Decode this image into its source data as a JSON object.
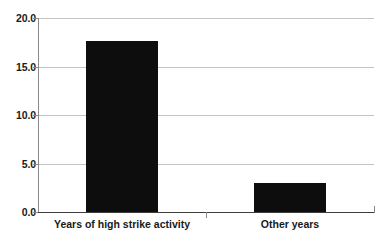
{
  "chart_data": {
    "type": "bar",
    "title": "",
    "subtitle": "",
    "xlabel": "",
    "ylabel": "",
    "categories": [
      "Years of high strike activity",
      "Other years"
    ],
    "values": [
      17.6,
      3.0
    ],
    "series": [
      {
        "name": "",
        "values": [
          17.6,
          3.0
        ]
      }
    ],
    "ylim": [
      0.0,
      20.0
    ],
    "ytick_labels": [
      "0.0",
      "5.0",
      "10.0",
      "15.0",
      "20.0"
    ],
    "ytick_values": [
      0.0,
      5.0,
      10.0,
      15.0,
      20.0
    ],
    "grid": true,
    "legend": "none",
    "annotations": [],
    "colors": {
      "bar": "#0d0d0d",
      "gridline": "#c4c4c4",
      "axis": "#3d3d3d",
      "tick": "#8a8a8a",
      "text": "#1a1a1a",
      "background": "#ffffff"
    }
  }
}
